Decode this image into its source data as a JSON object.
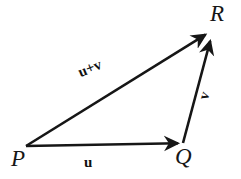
{
  "figure": {
    "name": "vector-addition-triangle",
    "background_color": "#ffffff",
    "stroke_color": "#161616",
    "width": 241,
    "height": 179
  },
  "vertices": [
    {
      "id": "P",
      "label": "P",
      "x": 26,
      "y": 146
    },
    {
      "id": "Q",
      "label": "Q",
      "x": 183,
      "y": 143
    },
    {
      "id": "R",
      "label": "R",
      "x": 213,
      "y": 33
    }
  ],
  "vectors": [
    {
      "id": "u",
      "label": "u",
      "from": "P",
      "to": "Q",
      "x1": 26,
      "y1": 146,
      "x2": 183,
      "y2": 143,
      "label_rotation_deg": 0
    },
    {
      "id": "v",
      "label": "v",
      "from": "Q",
      "to": "R",
      "x1": 183,
      "y1": 143,
      "x2": 211,
      "y2": 36,
      "label_rotation_deg": -72
    },
    {
      "id": "u-plus-v",
      "label": "u+v",
      "from": "P",
      "to": "R",
      "x1": 26,
      "y1": 146,
      "x2": 210,
      "y2": 32,
      "label_rotation_deg": -22
    }
  ]
}
